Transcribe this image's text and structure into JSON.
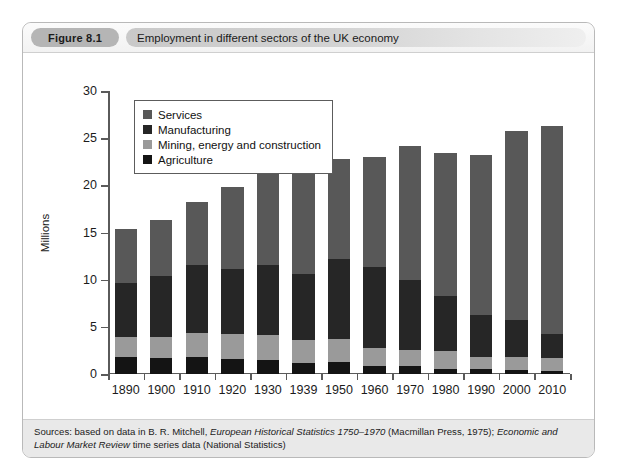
{
  "figure": {
    "badge": "Figure 8.1",
    "caption": "Employment in different sectors of the UK economy"
  },
  "source": {
    "prefix": "Sources: based on data in B. R. Mitchell, ",
    "italic1": "European Historical Statistics 1750–1970",
    "middle": " (Macmillan Press, 1975); ",
    "italic2": "Economic and Labour Market Review",
    "suffix": " time series data (National Statistics)"
  },
  "colors": {
    "services": "#585858",
    "manufacturing": "#262626",
    "mining": "#9a9a9a",
    "agriculture": "#141414",
    "axis": "#5a5a5a",
    "panel_border": "#b9b9b9",
    "header_badge": "#b5b5b5",
    "source_bg": "#e9e9e9"
  },
  "chart_data": {
    "type": "bar",
    "stacked": true,
    "title": "Employment in different sectors of the UK economy",
    "xlabel": "",
    "ylabel": "Millions",
    "ylim": [
      0,
      30
    ],
    "yticks": [
      0,
      5,
      10,
      15,
      20,
      25,
      30
    ],
    "grid": false,
    "legend_position": "top-left",
    "categories": [
      "1890",
      "1900",
      "1910",
      "1920",
      "1930",
      "1939",
      "1950",
      "1960",
      "1970",
      "1980",
      "1990",
      "2000",
      "2010"
    ],
    "series": [
      {
        "name": "Agriculture",
        "color": "#141414",
        "values": [
          1.8,
          1.7,
          1.8,
          1.6,
          1.5,
          1.2,
          1.3,
          0.9,
          0.8,
          0.5,
          0.5,
          0.4,
          0.3
        ]
      },
      {
        "name": "Mining, energy and construction",
        "color": "#9a9a9a",
        "values": [
          2.1,
          2.2,
          2.5,
          2.6,
          2.6,
          2.4,
          2.4,
          1.9,
          1.7,
          1.9,
          1.3,
          1.4,
          1.4
        ]
      },
      {
        "name": "Manufacturing",
        "color": "#262626",
        "values": [
          5.8,
          6.5,
          7.3,
          6.9,
          7.5,
          7.0,
          8.5,
          8.5,
          7.5,
          5.9,
          4.5,
          3.9,
          2.5
        ]
      },
      {
        "name": "Services",
        "color": "#585858",
        "values": [
          5.7,
          5.9,
          6.6,
          8.7,
          9.9,
          10.6,
          10.6,
          11.7,
          14.2,
          15.1,
          16.9,
          20.1,
          22.1
        ]
      }
    ],
    "totals": [
      15.4,
      16.3,
      18.2,
      19.8,
      21.5,
      21.2,
      22.8,
      23.0,
      24.2,
      23.4,
      23.2,
      25.8,
      26.3
    ]
  }
}
